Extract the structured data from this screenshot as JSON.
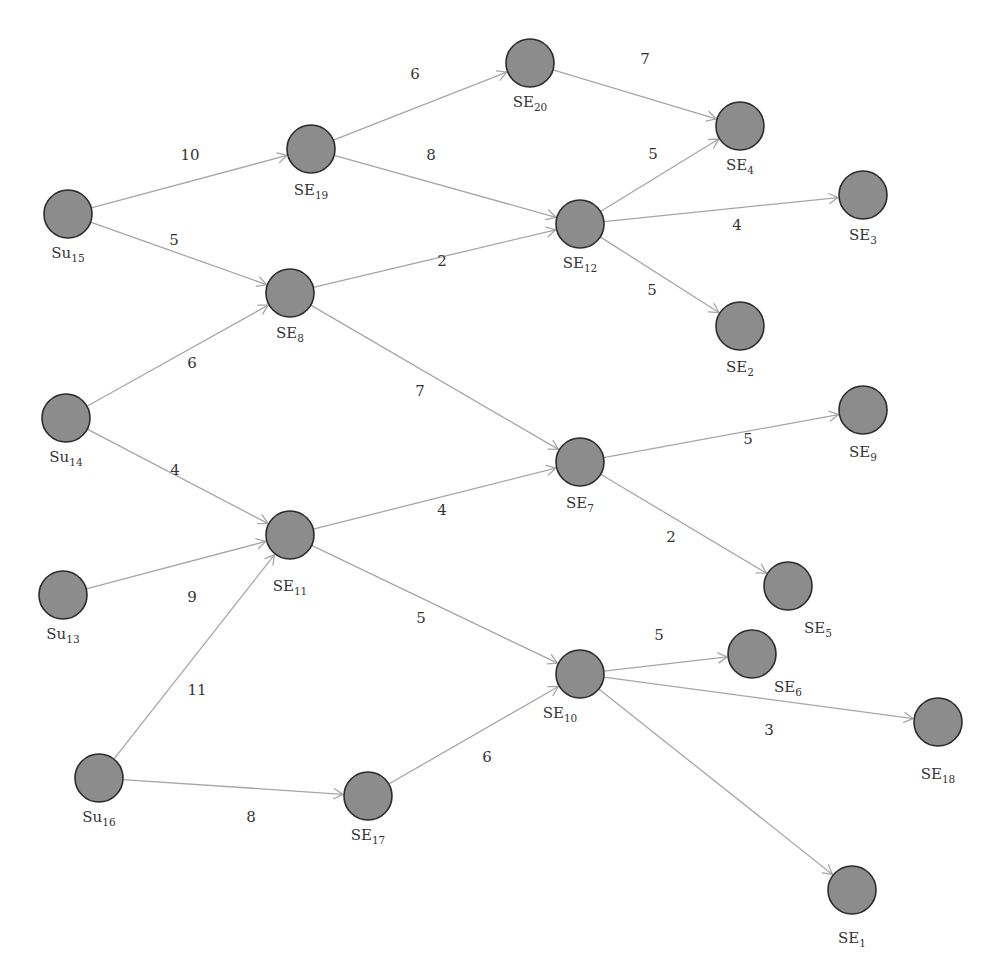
{
  "diagram": {
    "type": "directed-weighted-graph",
    "colors": {
      "node_fill": "#8c8c8c",
      "node_stroke": "#2b2b2b",
      "edge": "#a6a6a6",
      "text": "#333333",
      "background": "#ffffff"
    },
    "node_radius": 24,
    "nodes": [
      {
        "id": "Su15",
        "base": "Su",
        "sub": "15",
        "x": 68,
        "y": 214,
        "lx": 68,
        "ly": 258
      },
      {
        "id": "Su14",
        "base": "Su",
        "sub": "14",
        "x": 66,
        "y": 418,
        "lx": 66,
        "ly": 462
      },
      {
        "id": "Su13",
        "base": "Su",
        "sub": "13",
        "x": 63,
        "y": 595,
        "lx": 63,
        "ly": 639
      },
      {
        "id": "Su16",
        "base": "Su",
        "sub": "16",
        "x": 99,
        "y": 778,
        "lx": 99,
        "ly": 822
      },
      {
        "id": "SE19",
        "base": "SE",
        "sub": "19",
        "x": 311,
        "y": 149,
        "lx": 311,
        "ly": 195
      },
      {
        "id": "SE8",
        "base": "SE",
        "sub": "8",
        "x": 290,
        "y": 293,
        "lx": 290,
        "ly": 338
      },
      {
        "id": "SE11",
        "base": "SE",
        "sub": "11",
        "x": 290,
        "y": 535,
        "lx": 290,
        "ly": 591
      },
      {
        "id": "SE17",
        "base": "SE",
        "sub": "17",
        "x": 368,
        "y": 796,
        "lx": 368,
        "ly": 840
      },
      {
        "id": "SE20",
        "base": "SE",
        "sub": "20",
        "x": 530,
        "y": 63,
        "lx": 530,
        "ly": 107
      },
      {
        "id": "SE12",
        "base": "SE",
        "sub": "12",
        "x": 580,
        "y": 224,
        "lx": 580,
        "ly": 268
      },
      {
        "id": "SE7",
        "base": "SE",
        "sub": "7",
        "x": 580,
        "y": 462,
        "lx": 580,
        "ly": 508
      },
      {
        "id": "SE10",
        "base": "SE",
        "sub": "10",
        "x": 580,
        "y": 674,
        "lx": 560,
        "ly": 718
      },
      {
        "id": "SE4",
        "base": "SE",
        "sub": "4",
        "x": 740,
        "y": 126,
        "lx": 740,
        "ly": 170
      },
      {
        "id": "SE3",
        "base": "SE",
        "sub": "3",
        "x": 863,
        "y": 195,
        "lx": 863,
        "ly": 240
      },
      {
        "id": "SE2",
        "base": "SE",
        "sub": "2",
        "x": 740,
        "y": 326,
        "lx": 740,
        "ly": 372
      },
      {
        "id": "SE9",
        "base": "SE",
        "sub": "9",
        "x": 863,
        "y": 410,
        "lx": 863,
        "ly": 457
      },
      {
        "id": "SE5",
        "base": "SE",
        "sub": "5",
        "x": 788,
        "y": 586,
        "lx": 818,
        "ly": 633
      },
      {
        "id": "SE6",
        "base": "SE",
        "sub": "6",
        "x": 752,
        "y": 654,
        "lx": 788,
        "ly": 692
      },
      {
        "id": "SE18",
        "base": "SE",
        "sub": "18",
        "x": 938,
        "y": 722,
        "lx": 938,
        "ly": 779
      },
      {
        "id": "SE1",
        "base": "SE",
        "sub": "1",
        "x": 852,
        "y": 890,
        "lx": 852,
        "ly": 943
      }
    ],
    "edges": [
      {
        "from": "Su15",
        "to": "SE19",
        "weight": "10",
        "wx": 190,
        "wy": 160
      },
      {
        "from": "Su15",
        "to": "SE8",
        "weight": "5",
        "wx": 174,
        "wy": 245
      },
      {
        "from": "Su14",
        "to": "SE8",
        "weight": "6",
        "wx": 192,
        "wy": 368
      },
      {
        "from": "Su14",
        "to": "SE11",
        "weight": "4",
        "wx": 175,
        "wy": 475
      },
      {
        "from": "Su13",
        "to": "SE11",
        "weight": "9",
        "wx": 192,
        "wy": 602
      },
      {
        "from": "Su16",
        "to": "SE11",
        "weight": "11",
        "wx": 197,
        "wy": 695
      },
      {
        "from": "Su16",
        "to": "SE17",
        "weight": "8",
        "wx": 251,
        "wy": 822
      },
      {
        "from": "SE19",
        "to": "SE20",
        "weight": "6",
        "wx": 415,
        "wy": 79
      },
      {
        "from": "SE19",
        "to": "SE12",
        "weight": "8",
        "wx": 431,
        "wy": 160
      },
      {
        "from": "SE8",
        "to": "SE12",
        "weight": "2",
        "wx": 442,
        "wy": 266
      },
      {
        "from": "SE8",
        "to": "SE7",
        "weight": "7",
        "wx": 420,
        "wy": 396
      },
      {
        "from": "SE11",
        "to": "SE7",
        "weight": "4",
        "wx": 442,
        "wy": 515
      },
      {
        "from": "SE11",
        "to": "SE10",
        "weight": "5",
        "wx": 421,
        "wy": 623
      },
      {
        "from": "SE17",
        "to": "SE10",
        "weight": "6",
        "wx": 487,
        "wy": 762
      },
      {
        "from": "SE20",
        "to": "SE4",
        "weight": "7",
        "wx": 645,
        "wy": 64
      },
      {
        "from": "SE12",
        "to": "SE4",
        "weight": "5",
        "wx": 653,
        "wy": 159
      },
      {
        "from": "SE12",
        "to": "SE3",
        "weight": "4",
        "wx": 737,
        "wy": 230
      },
      {
        "from": "SE12",
        "to": "SE2",
        "weight": "5",
        "wx": 652,
        "wy": 295
      },
      {
        "from": "SE7",
        "to": "SE9",
        "weight": "5",
        "wx": 748,
        "wy": 444
      },
      {
        "from": "SE7",
        "to": "SE5",
        "weight": "2",
        "wx": 671,
        "wy": 542
      },
      {
        "from": "SE10",
        "to": "SE6",
        "weight": "5",
        "wx": 659,
        "wy": 640
      },
      {
        "from": "SE10",
        "to": "SE18",
        "weight": "3",
        "wx": 769,
        "wy": 735
      },
      {
        "from": "SE10",
        "to": "SE1",
        "weight": "",
        "wx": 0,
        "wy": 0
      }
    ]
  }
}
